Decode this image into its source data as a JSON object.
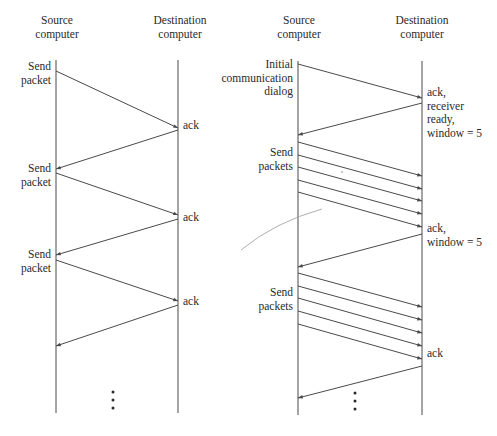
{
  "figure": {
    "colors": {
      "line": "#4a4a4a",
      "text": "#2a2a2a",
      "background": "#ffffff",
      "stray_curve": "#9a9a9a"
    },
    "stop_and_wait": {
      "source_header": "Source\ncomputer",
      "dest_header": "Destination\ncomputer",
      "source_x": 56,
      "dest_x": 178,
      "timeline_top": 60,
      "timeline_bottom": 413,
      "labels": [
        {
          "text": "Send\npacket",
          "side": "source",
          "y": 60
        },
        {
          "text": "ack",
          "side": "dest",
          "y": 119
        },
        {
          "text": "Send\npacket",
          "side": "source",
          "y": 162
        },
        {
          "text": "ack",
          "side": "dest",
          "y": 211
        },
        {
          "text": "Send\npacket",
          "side": "source",
          "y": 248
        },
        {
          "text": "ack",
          "side": "dest",
          "y": 295
        }
      ],
      "arrows": [
        {
          "from": "source",
          "y1": 71,
          "y2": 128
        },
        {
          "from": "dest",
          "y1": 130,
          "y2": 169
        },
        {
          "from": "source",
          "y1": 173,
          "y2": 215
        },
        {
          "from": "dest",
          "y1": 219,
          "y2": 255
        },
        {
          "from": "source",
          "y1": 260,
          "y2": 301
        },
        {
          "from": "dest",
          "y1": 305,
          "y2": 346
        }
      ],
      "ellipsis_x": 113,
      "ellipsis_y": [
        392,
        400,
        408
      ]
    },
    "sliding_window": {
      "source_header": "Source\ncomputer",
      "dest_header": "Destination\ncomputer",
      "source_x": 298,
      "dest_x": 422,
      "timeline_top": 61,
      "timeline_bottom": 415,
      "labels": [
        {
          "text": "Initial\ncommunication\ndialog",
          "side": "source",
          "y": 58
        },
        {
          "text": "ack,\nreceiver\nready,\nwindow = 5",
          "side": "dest",
          "y": 86
        },
        {
          "text": "Send\npackets",
          "side": "source",
          "y": 146
        },
        {
          "text": "ack,\nwindow = 5",
          "side": "dest",
          "y": 222
        },
        {
          "text": "Send\npackets",
          "side": "source",
          "y": 286
        },
        {
          "text": "ack",
          "side": "dest",
          "y": 347
        }
      ],
      "arrows": [
        {
          "from": "source",
          "y1": 64,
          "y2": 98
        },
        {
          "from": "dest",
          "y1": 103,
          "y2": 135
        },
        {
          "from": "source",
          "y1": 142,
          "y2": 176
        },
        {
          "from": "source",
          "y1": 155,
          "y2": 189
        },
        {
          "from": "source",
          "y1": 167,
          "y2": 201
        },
        {
          "from": "source",
          "y1": 180,
          "y2": 214
        },
        {
          "from": "source",
          "y1": 192,
          "y2": 227
        },
        {
          "from": "dest",
          "y1": 234,
          "y2": 267
        },
        {
          "from": "source",
          "y1": 273,
          "y2": 307
        },
        {
          "from": "source",
          "y1": 286,
          "y2": 320
        },
        {
          "from": "source",
          "y1": 298,
          "y2": 333
        },
        {
          "from": "source",
          "y1": 311,
          "y2": 346
        },
        {
          "from": "source",
          "y1": 324,
          "y2": 359
        },
        {
          "from": "dest",
          "y1": 366,
          "y2": 398
        }
      ],
      "ellipsis_x": 355,
      "ellipsis_y": [
        393,
        401,
        409
      ]
    },
    "stray_marks": [
      {
        "type": "curve",
        "path": "M241,250 Q275,222 322,209"
      },
      {
        "type": "tick",
        "x": 342,
        "y": 171
      }
    ]
  }
}
